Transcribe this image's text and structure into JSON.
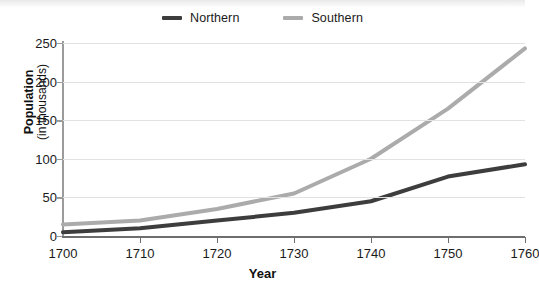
{
  "chart_data": {
    "type": "line",
    "title": "",
    "subtitle": "",
    "xlabel": "Year",
    "ylabel": "Population (in thousands)",
    "ylabel_main": "Population",
    "ylabel_sub": "(in thousands)",
    "x": [
      1700,
      1710,
      1720,
      1730,
      1740,
      1750,
      1760
    ],
    "xtick_labels": [
      "1700",
      "1710",
      "1720",
      "1730",
      "1740",
      "1750",
      "1760"
    ],
    "ytick_labels": [
      "0",
      "50",
      "100",
      "150",
      "200",
      "250"
    ],
    "yticks": [
      0,
      50,
      100,
      150,
      200,
      250
    ],
    "xlim": [
      1700,
      1760
    ],
    "ylim": [
      0,
      250
    ],
    "grid": true,
    "grid_axis": "y",
    "legend_position": "top-center",
    "series": [
      {
        "name": "Northern",
        "color": "#3d3d3d",
        "values": [
          5,
          10,
          20,
          30,
          45,
          77,
          93
        ]
      },
      {
        "name": "Southern",
        "color": "#ababab",
        "values": [
          15,
          20,
          35,
          55,
          100,
          165,
          243
        ]
      }
    ]
  },
  "legend": {
    "entries": [
      {
        "label": "Northern",
        "color": "#3d3d3d"
      },
      {
        "label": "Southern",
        "color": "#ababab"
      }
    ]
  },
  "colors": {
    "northern": "#3d3d3d",
    "southern": "#ababab",
    "gridline": "#e2e2e2",
    "axis": "#6e6e6e",
    "text": "#1a1a1a",
    "background": "#ffffff"
  }
}
